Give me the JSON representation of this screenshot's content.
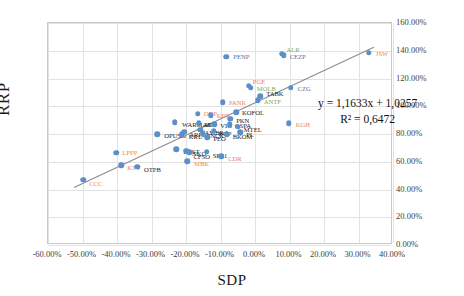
{
  "chart_data": {
    "type": "scatter",
    "title": "",
    "xlabel": "SDP",
    "ylabel": "RRP",
    "xlim": [
      -0.6,
      0.4
    ],
    "ylim": [
      0.0,
      1.6
    ],
    "xticks": [
      "-60.00%",
      "-50.00%",
      "-40.00%",
      "-30.00%",
      "-20.00%",
      "-10.00%",
      "0.00%",
      "10.00%",
      "20.00%",
      "30.00%",
      "40.00%"
    ],
    "xtick_values": [
      -0.6,
      -0.5,
      -0.4,
      -0.3,
      -0.2,
      -0.1,
      0.0,
      0.1,
      0.2,
      0.3,
      0.4
    ],
    "yticks": [
      "0.00%",
      "20.00%",
      "40.00%",
      "60.00%",
      "80.00%",
      "100.00%",
      "120.00%",
      "140.00%",
      "160.00%"
    ],
    "ytick_values": [
      0.0,
      0.2,
      0.4,
      0.6,
      0.8,
      1.0,
      1.2,
      1.4,
      1.6
    ],
    "grid": true,
    "yaxis_position": "right",
    "legend": "none",
    "trendline": {
      "equation": "y = 1,1633x + 1,0257",
      "r2": "R² = 0,6472",
      "slope": 1.1633,
      "intercept": 1.0257,
      "r_squared": 0.6472
    },
    "marker_color": "#5b8fc9",
    "trendline_color": "#8a8a8a",
    "points": [
      {
        "label": "CCC",
        "x": -0.498,
        "y": 0.47,
        "color": "orange",
        "lx": 6,
        "ly": 4
      },
      {
        "label": "LPPP",
        "x": -0.402,
        "y": 0.665,
        "color": "orange",
        "lx": 6,
        "ly": 0
      },
      {
        "label": "KTY",
        "x": -0.388,
        "y": 0.575,
        "color": "orange",
        "lx": 6,
        "ly": 3
      },
      {
        "label": "OTPB",
        "x": -0.342,
        "y": 0.565,
        "color": "dark",
        "lx": 7,
        "ly": 3
      },
      {
        "label": "OPUSG",
        "x": -0.283,
        "y": 0.8,
        "color": "dark",
        "lx": 7,
        "ly": 2
      },
      {
        "label": "WARMAK",
        "x": -0.232,
        "y": 0.885,
        "color": "dark",
        "lx": 7,
        "ly": 3
      },
      {
        "label": "KRU",
        "x": -0.212,
        "y": 0.8,
        "color": "dark",
        "lx": 7,
        "ly": 3
      },
      {
        "label": "EBST",
        "x": -0.228,
        "y": 0.69,
        "color": "dark",
        "lx": 7,
        "ly": 3
      },
      {
        "label": "ARPL",
        "x": -0.205,
        "y": 0.815,
        "color": "dark",
        "lx": 5,
        "ly": 3
      },
      {
        "label": "NKO",
        "x": -0.2,
        "y": 0.678,
        "color": "dark",
        "lx": 6,
        "ly": 3
      },
      {
        "label": "CFSO",
        "x": -0.19,
        "y": 0.668,
        "color": "dark",
        "lx": 4,
        "ly": 5
      },
      {
        "label": "MBK",
        "x": -0.197,
        "y": 0.602,
        "color": "orange",
        "lx": 7,
        "ly": 3
      },
      {
        "label": "DNP",
        "x": -0.166,
        "y": 0.945,
        "color": "orange",
        "lx": 6,
        "ly": 0
      },
      {
        "label": "ATT",
        "x": -0.163,
        "y": 0.878,
        "color": "dark",
        "lx": 5,
        "ly": 2
      },
      {
        "label": "AMBRA",
        "x": -0.158,
        "y": 0.832,
        "color": "dark",
        "lx": 4,
        "ly": 3
      },
      {
        "label": "SNCK",
        "x": -0.152,
        "y": 0.805,
        "color": "dark",
        "lx": 4,
        "ly": 3
      },
      {
        "label": "SPL1",
        "x": -0.14,
        "y": 0.672,
        "color": "dark",
        "lx": 6,
        "ly": 4
      },
      {
        "label": "PEO",
        "x": -0.138,
        "y": 0.775,
        "color": "dark",
        "lx": 6,
        "ly": 2
      },
      {
        "label": "KPX",
        "x": -0.128,
        "y": 0.935,
        "color": "orange",
        "lx": 6,
        "ly": 1
      },
      {
        "label": "VIG",
        "x": -0.118,
        "y": 0.872,
        "color": "dark",
        "lx": 6,
        "ly": 2
      },
      {
        "label": "BGP",
        "x": -0.12,
        "y": 0.822,
        "color": "dark",
        "lx": 5,
        "ly": 3
      },
      {
        "label": "PANK",
        "x": -0.093,
        "y": 1.03,
        "color": "orange",
        "lx": 6,
        "ly": 1
      },
      {
        "label": "CDR",
        "x": -0.098,
        "y": 0.64,
        "color": "orange",
        "lx": 7,
        "ly": 3
      },
      {
        "label": "BKOM",
        "x": -0.082,
        "y": 0.8,
        "color": "dark",
        "lx": 6,
        "ly": 3
      },
      {
        "label": "GSPA",
        "x": -0.073,
        "y": 0.872,
        "color": "dark",
        "lx": 5,
        "ly": 2
      },
      {
        "label": "PKN",
        "x": -0.072,
        "y": 0.91,
        "color": "dark",
        "lx": 6,
        "ly": 2
      },
      {
        "label": "KOFOL",
        "x": -0.055,
        "y": 0.955,
        "color": "dark",
        "lx": 6,
        "ly": 1
      },
      {
        "label": "MTEL",
        "x": -0.05,
        "y": 0.852,
        "color": "dark",
        "lx": 6,
        "ly": 3
      },
      {
        "label": "PL",
        "x": -0.043,
        "y": 0.812,
        "color": "dark",
        "lx": 6,
        "ly": 3
      },
      {
        "label": "PENP",
        "x": -0.083,
        "y": 1.355,
        "color": "blue",
        "lx": 7,
        "ly": 0
      },
      {
        "label": "PGE",
        "x": -0.018,
        "y": 1.148,
        "color": "orange",
        "lx": 4,
        "ly": -4
      },
      {
        "label": "MOLB",
        "x": -0.012,
        "y": 1.132,
        "color": "green",
        "lx": 6,
        "ly": 1
      },
      {
        "label": "ANTF",
        "x": 0.008,
        "y": 1.042,
        "color": "green",
        "lx": 6,
        "ly": 2
      },
      {
        "label": "TABK",
        "x": 0.015,
        "y": 1.072,
        "color": "dark",
        "lx": 6,
        "ly": -2
      },
      {
        "label": "ALR",
        "x": 0.077,
        "y": 1.378,
        "color": "green",
        "lx": 5,
        "ly": -4
      },
      {
        "label": "CEZP",
        "x": 0.083,
        "y": 1.368,
        "color": "blue",
        "lx": 6,
        "ly": 2
      },
      {
        "label": "CZG",
        "x": 0.103,
        "y": 1.135,
        "color": "blue",
        "lx": 7,
        "ly": 1
      },
      {
        "label": "KGH",
        "x": 0.098,
        "y": 0.878,
        "color": "orange",
        "lx": 7,
        "ly": 2
      },
      {
        "label": "JSW",
        "x": 0.33,
        "y": 1.385,
        "color": "orange",
        "lx": 7,
        "ly": 1
      }
    ]
  }
}
